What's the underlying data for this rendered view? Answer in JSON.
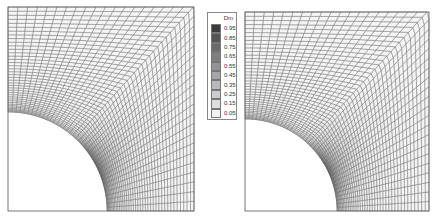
{
  "figure": {
    "panels": [
      {
        "name": "left",
        "x": 8,
        "y": 7,
        "w": 186,
        "h": 204,
        "hole_radius": 99
      },
      {
        "name": "right",
        "x": 245,
        "y": 12,
        "w": 184,
        "h": 199,
        "hole_radius": 92
      }
    ],
    "legend": {
      "title": "Dm",
      "levels": [
        {
          "label": "0.95",
          "color": "#3c3c3c"
        },
        {
          "label": "0.85",
          "color": "#555555"
        },
        {
          "label": "0.75",
          "color": "#6b6b6b"
        },
        {
          "label": "0.65",
          "color": "#7f7f7f"
        },
        {
          "label": "0.55",
          "color": "#939393"
        },
        {
          "label": "0.45",
          "color": "#a6a6a6"
        },
        {
          "label": "0.35",
          "color": "#b9b9b9"
        },
        {
          "label": "0.25",
          "color": "#cccccc"
        },
        {
          "label": "0.15",
          "color": "#dedede"
        },
        {
          "label": "0.05",
          "color": "#f2f2f2"
        }
      ]
    }
  }
}
